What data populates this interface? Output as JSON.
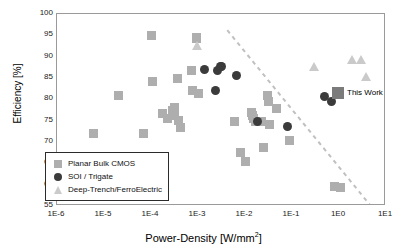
{
  "chart_data": {
    "type": "scatter",
    "title": "",
    "xlabel": "Power-Density [W/mm2]",
    "xlabel_base": "Power-Density [W/mm",
    "xlabel_sup": "2",
    "xlabel_tail": "]",
    "ylabel": "Efficiency [%]",
    "xscale": "log",
    "xlim": [
      1e-06,
      10
    ],
    "ylim": [
      55,
      100
    ],
    "grid": false,
    "xticks": [
      "1E-6",
      "1E-5",
      "1E-4",
      "1E-3",
      "1E-2",
      "1E-1",
      "1E0",
      "1E1"
    ],
    "xtick_values": [
      1e-06,
      1e-05,
      0.0001,
      0.001,
      0.01,
      0.1,
      1,
      10
    ],
    "yticks": [
      "100",
      "95",
      "90",
      "85",
      "80",
      "75",
      "70",
      "65",
      "60",
      "55"
    ],
    "ytick_values": [
      100,
      95,
      90,
      85,
      80,
      75,
      70,
      65,
      60,
      55
    ],
    "legend_position": "lower-left",
    "annotations": [
      {
        "text": "This Work",
        "x": 1.0,
        "y": 81.5
      }
    ],
    "trend_line": {
      "style": "dashed",
      "color": "#c0c0c0",
      "x_start": 0.0042,
      "y_start": 96.2,
      "x_end": 4.6,
      "y_end": 55.2
    },
    "series": [
      {
        "name": "Planar Bulk CMOS",
        "marker": "square",
        "color": "#aeaeae",
        "points": [
          [
            6e-06,
            72.0
          ],
          [
            2e-05,
            81.0
          ],
          [
            7e-05,
            72.0
          ],
          [
            0.000105,
            95.0
          ],
          [
            0.00011,
            84.2
          ],
          [
            0.000175,
            76.7
          ],
          [
            0.00022,
            75.6
          ],
          [
            0.00029,
            77.3
          ],
          [
            0.00031,
            76.3
          ],
          [
            0.00032,
            78.0
          ],
          [
            0.00036,
            84.9
          ],
          [
            0.00038,
            75.1
          ],
          [
            0.00042,
            73.4
          ],
          [
            0.00072,
            86.8
          ],
          [
            0.00076,
            82.0
          ],
          [
            0.00092,
            94.6
          ],
          [
            0.00094,
            94.3
          ],
          [
            0.00105,
            81.3
          ],
          [
            0.006,
            74.7
          ],
          [
            0.008,
            67.6
          ],
          [
            0.01,
            65.5
          ],
          [
            0.0135,
            76.8
          ],
          [
            0.0145,
            76.2
          ],
          [
            0.0155,
            75.6
          ],
          [
            0.017,
            74.8
          ],
          [
            0.019,
            74.8
          ],
          [
            0.022,
            74.8
          ],
          [
            0.025,
            68.6
          ],
          [
            0.03,
            80.9
          ],
          [
            0.032,
            79.6
          ],
          [
            0.034,
            74.0
          ],
          [
            0.046,
            77.9
          ],
          [
            0.09,
            70.3
          ],
          [
            0.8,
            59.5
          ],
          [
            1.1,
            59.4
          ]
        ]
      },
      {
        "name": "SOI / Trigate",
        "marker": "circle",
        "color": "#3b3b3b",
        "points": [
          [
            0.0014,
            86.9
          ],
          [
            0.0026,
            86.8
          ],
          [
            0.003,
            87.6
          ],
          [
            0.0032,
            87.8
          ],
          [
            0.0024,
            82.0
          ],
          [
            0.0066,
            85.7
          ],
          [
            0.0185,
            74.8
          ],
          [
            0.08,
            73.7
          ],
          [
            0.5,
            80.7
          ],
          [
            0.7,
            79.4
          ]
        ]
      },
      {
        "name": "Deep-Trench/FerroElectric",
        "marker": "triangle",
        "color": "#cacaca",
        "points": [
          [
            0.00093,
            92.6
          ],
          [
            0.3,
            87.6
          ],
          [
            1.9,
            89.4
          ],
          [
            3.0,
            89.4
          ],
          [
            3.8,
            85.4
          ]
        ]
      },
      {
        "name": "This Work",
        "marker": "square-large",
        "color": "#7b7b7b",
        "points": [
          [
            0.95,
            81.5
          ]
        ]
      }
    ]
  },
  "legend": {
    "items": [
      {
        "label": "Planar Bulk CMOS",
        "marker": "square"
      },
      {
        "label": "SOI / Trigate",
        "marker": "circle"
      },
      {
        "label": "Deep-Trench/FerroElectric",
        "marker": "triangle"
      }
    ]
  }
}
